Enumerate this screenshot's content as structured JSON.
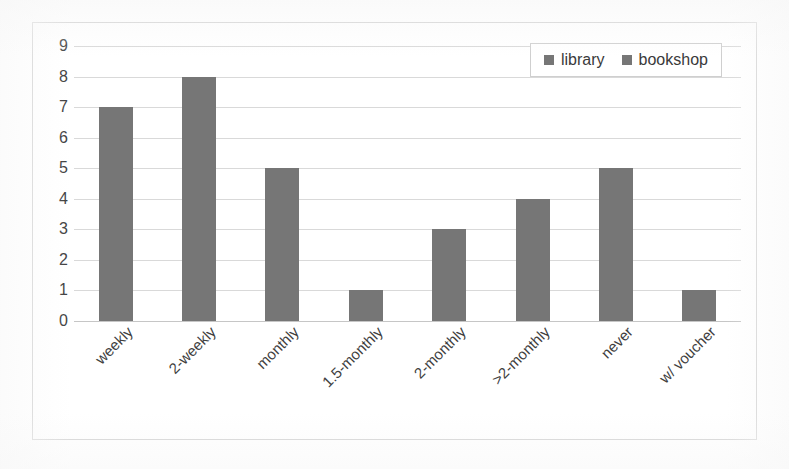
{
  "chart_data": {
    "type": "bar",
    "title": "",
    "subtitle": "",
    "xlabel": "",
    "ylabel": "",
    "categories": [
      "weekly",
      "2-weekly",
      "monthly",
      "1.5-monthly",
      "2-monthly",
      ">2-monthly",
      "never",
      "w/ voucher"
    ],
    "series": [
      {
        "name": "library",
        "values": [
          7,
          8,
          5,
          1,
          3,
          4,
          5,
          1
        ]
      }
    ],
    "values": [
      7,
      8,
      5,
      1,
      3,
      4,
      5,
      1
    ],
    "ylim": [
      0,
      9
    ],
    "ytick_labels": [
      "9",
      "8",
      "7",
      "6",
      "5",
      "4",
      "3",
      "2",
      "1",
      "0"
    ],
    "ytick_values": [
      9,
      8,
      7,
      6,
      5,
      4,
      3,
      2,
      1,
      0
    ],
    "ystep": 1,
    "grid": true,
    "grid_axis": "y",
    "legend_position": "top-right",
    "legend_entries": [
      "library",
      "bookshop"
    ],
    "bar_color": "#767676",
    "gridline_color": "#d9d9d9",
    "frame_color": "#d2d2d2",
    "background_color": "#ffffff",
    "xtick_label_rotation": -45,
    "annotations": []
  },
  "legend": {
    "items": [
      {
        "label": "library",
        "color": "#767676"
      },
      {
        "label": "bookshop",
        "color": "#767676"
      }
    ]
  }
}
